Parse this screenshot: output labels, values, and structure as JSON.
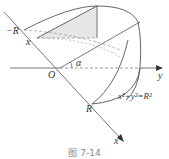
{
  "figure": {
    "caption": "图 7-14",
    "labels": {
      "neg_r": "−R",
      "x_upper": "x",
      "origin": "O",
      "alpha": "α",
      "y_axis": "y",
      "r": "R",
      "x_axis": "x",
      "equation": "x²+y²=R²"
    },
    "colors": {
      "line": "#555555",
      "shade": "#e6e6e6",
      "dash": "#888888"
    }
  }
}
